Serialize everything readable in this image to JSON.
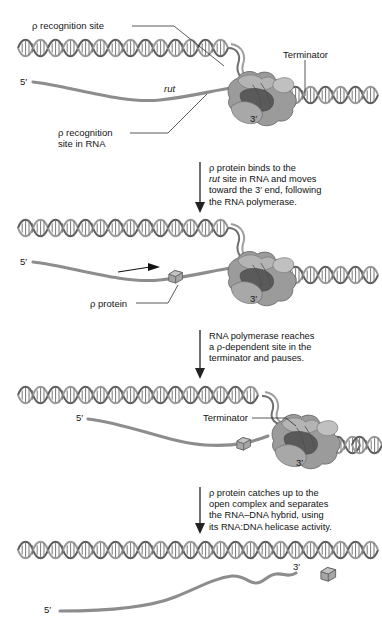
{
  "figure": {
    "background": "#ffffff",
    "ink": "#3f3f3f"
  },
  "panels": [
    {
      "id": "panel-1",
      "labels": {
        "rho_recognition_site": "ρ recognition site",
        "terminator": "Terminator",
        "five_prime": "5′",
        "rut": "rut",
        "rho_recognition_site_in_rna": "ρ recognition\nsite in RNA",
        "three_prime": "3′"
      }
    },
    {
      "id": "panel-2",
      "labels": {
        "five_prime": "5′",
        "rho_protein": "ρ protein",
        "three_prime": "3′"
      }
    },
    {
      "id": "panel-3",
      "labels": {
        "five_prime": "5′",
        "terminator": "Terminator",
        "three_prime": "3′"
      }
    },
    {
      "id": "panel-4",
      "labels": {
        "five_prime": "5′",
        "three_prime": "3′"
      }
    }
  ],
  "captions": [
    {
      "id": "caption-1",
      "text": "ρ protein binds to the\nrut site in RNA and moves\ntoward the 3′ end, following\nthe RNA polymerase.",
      "italic_word": "rut"
    },
    {
      "id": "caption-2",
      "text": "RNA polymerase reaches\na ρ-dependent site in the\nterminator and pauses."
    },
    {
      "id": "caption-3",
      "text": "ρ protein catches up to the\nopen complex and separates\nthe RNA–DNA hybrid, using\nits RNA:DNA helicase activity."
    }
  ],
  "icons": {
    "dna_helix": "dna-double-helix-icon",
    "rna_polymerase": "rna-polymerase-blob-icon",
    "rho_protein": "rho-protein-cube-icon",
    "arrow_down": "arrow-down-icon",
    "arrow_right": "arrow-right-icon",
    "leader_line": "leader-line-icon"
  }
}
